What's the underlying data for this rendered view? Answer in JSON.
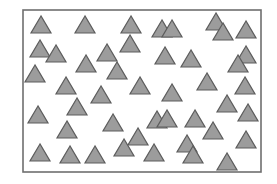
{
  "figure": {
    "frame": {
      "x": 23,
      "y": 10,
      "width": 238,
      "height": 162,
      "stroke": "#6f6f6f",
      "stroke_width": 1.6
    },
    "triangle_style": {
      "fill": "#9c9c9c",
      "stroke": "#5c5c5c",
      "stroke_width": 1.2,
      "width": 20,
      "height": 17
    },
    "triangle_count": 45,
    "triangles": [
      {
        "cx": 41,
        "base": 33
      },
      {
        "cx": 85,
        "base": 33
      },
      {
        "cx": 131,
        "base": 33
      },
      {
        "cx": 162,
        "base": 37
      },
      {
        "cx": 172,
        "base": 37
      },
      {
        "cx": 216,
        "base": 30
      },
      {
        "cx": 223,
        "base": 40
      },
      {
        "cx": 246,
        "base": 38
      },
      {
        "cx": 40,
        "base": 57
      },
      {
        "cx": 56,
        "base": 62
      },
      {
        "cx": 107,
        "base": 61
      },
      {
        "cx": 130,
        "base": 52
      },
      {
        "cx": 165,
        "base": 64
      },
      {
        "cx": 191,
        "base": 67
      },
      {
        "cx": 246,
        "base": 63
      },
      {
        "cx": 238,
        "base": 72
      },
      {
        "cx": 35,
        "base": 82
      },
      {
        "cx": 86,
        "base": 72
      },
      {
        "cx": 117,
        "base": 79
      },
      {
        "cx": 66,
        "base": 94
      },
      {
        "cx": 140,
        "base": 94
      },
      {
        "cx": 172,
        "base": 101
      },
      {
        "cx": 207,
        "base": 90
      },
      {
        "cx": 245,
        "base": 94
      },
      {
        "cx": 101,
        "base": 103
      },
      {
        "cx": 77,
        "base": 115
      },
      {
        "cx": 38,
        "base": 123
      },
      {
        "cx": 157,
        "base": 128
      },
      {
        "cx": 167,
        "base": 127
      },
      {
        "cx": 195,
        "base": 127
      },
      {
        "cx": 227,
        "base": 112
      },
      {
        "cx": 248,
        "base": 121
      },
      {
        "cx": 67,
        "base": 138
      },
      {
        "cx": 113,
        "base": 131
      },
      {
        "cx": 138,
        "base": 145
      },
      {
        "cx": 213,
        "base": 139
      },
      {
        "cx": 246,
        "base": 148
      },
      {
        "cx": 187,
        "base": 152
      },
      {
        "cx": 40,
        "base": 161
      },
      {
        "cx": 70,
        "base": 163
      },
      {
        "cx": 95,
        "base": 163
      },
      {
        "cx": 124,
        "base": 156
      },
      {
        "cx": 154,
        "base": 161
      },
      {
        "cx": 193,
        "base": 163
      },
      {
        "cx": 227,
        "base": 170
      }
    ]
  }
}
